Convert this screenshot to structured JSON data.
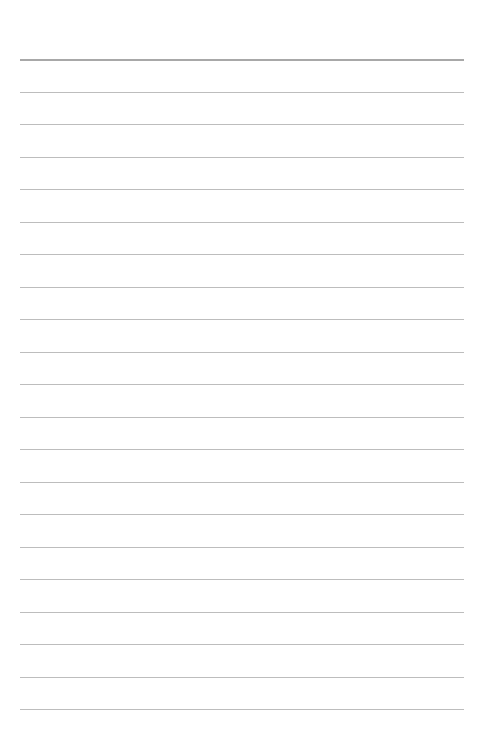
{
  "page": {
    "type": "lined-paper",
    "background_color": "#ffffff",
    "line_color": "#bdbdbd",
    "header_line_color": "#a8a8a8",
    "line_count": 21,
    "first_line_y": 59,
    "line_spacing": 32.5,
    "line_left": 20,
    "line_right": 464
  }
}
